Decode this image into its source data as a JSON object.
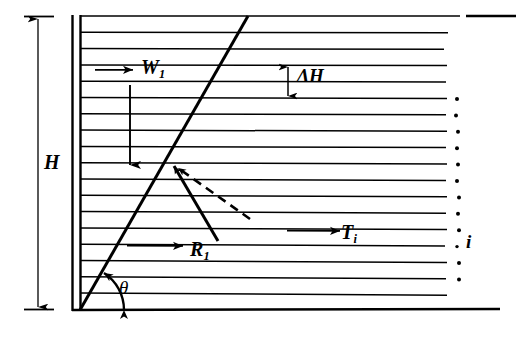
{
  "figure": {
    "type": "engineering-diagram",
    "background_color": "#ffffff",
    "ink_color": "#000000",
    "width": 532,
    "height": 338
  },
  "labels": {
    "wall_height": "H",
    "slice_weight": "W",
    "slice_weight_sub": "1",
    "slice_thickness": "ΔH",
    "reaction_force": "R",
    "reaction_force_sub": "1",
    "interslice_force": "T",
    "interslice_force_sub": "i",
    "slice_index": "i",
    "failure_angle": "θ"
  },
  "geometry": {
    "wall": {
      "outer_x": 72,
      "inner_x": 80,
      "top_y": 16,
      "bottom_y": 310
    },
    "ground_surface_y": 16,
    "base_y": 310,
    "base_right_x": 500,
    "ground_dash": {
      "x1": 466,
      "x2": 516,
      "y": 16
    },
    "failure_plane": {
      "x1": 80,
      "y1": 310,
      "x2": 248,
      "y2": 16
    },
    "slice_lines": {
      "count": 18,
      "left_x": 80,
      "top_y": 16,
      "spacing": 16.3,
      "long_right_x": 425,
      "dot_x": 455,
      "dotted_from_index": 5
    }
  },
  "dimension_h": {
    "x": 38,
    "top_y": 16,
    "bottom_y": 310,
    "tick_half_width": 14
  },
  "vectors": {
    "W1": {
      "name": "slice-weight-vector",
      "pointer_arrow": {
        "x1": 96,
        "y1": 70,
        "x2": 131,
        "y2": 70,
        "direction": "right"
      },
      "body_arrow": {
        "x": 130,
        "y1": 85,
        "y2": 163,
        "direction": "down"
      }
    },
    "R1": {
      "name": "reaction-force-vector",
      "line": {
        "x1": 172,
        "y1": 164,
        "x2": 218,
        "y2": 240
      },
      "arrow_at": "start",
      "pointer_arrow": {
        "x1": 128,
        "y1": 246,
        "x2": 181,
        "y2": 246,
        "direction": "right"
      }
    },
    "R1_dashed": {
      "name": "reaction-direction-dashed",
      "line": {
        "x1": 249,
        "y1": 218,
        "x2": 176,
        "y2": 167
      },
      "arrow_at": "end",
      "dash": "9,6"
    },
    "Ti": {
      "name": "interslice-force-vector",
      "pointer_arrow": {
        "x1": 288,
        "y1": 231,
        "x2": 338,
        "y2": 231,
        "direction": "right"
      }
    },
    "dH": {
      "name": "slice-thickness-dimension",
      "x": 288,
      "top_y": 65,
      "bottom_y": 98,
      "arrows": "both"
    },
    "theta": {
      "name": "failure-angle-arc",
      "center_x": 80,
      "center_y": 310,
      "radius": 44,
      "arrows": "both"
    }
  }
}
